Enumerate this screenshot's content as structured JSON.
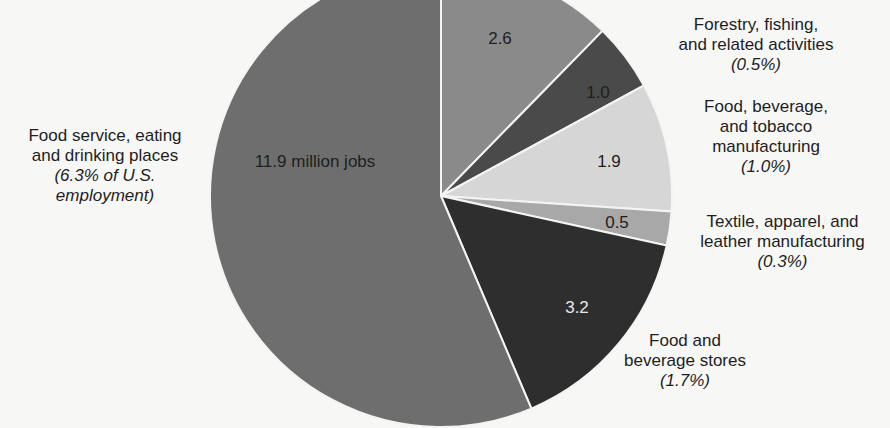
{
  "chart_data": {
    "type": "pie",
    "title": "",
    "units": "million jobs",
    "start_angle_deg": 0,
    "direction": "clockwise",
    "slices": [
      {
        "name": "(cut off, unlabeled)",
        "value": 2.6,
        "value_label": "2.6",
        "share_label": "",
        "color": "#8a8a8a"
      },
      {
        "name": "Forestry, fishing, and related activities",
        "value": 1.0,
        "value_label": "1.0",
        "share_label": "(0.5%)",
        "color": "#4a4a4a"
      },
      {
        "name": "Food, beverage, and tobacco manufacturing",
        "value": 1.9,
        "value_label": "1.9",
        "share_label": "(1.0%)",
        "color": "#d6d6d6"
      },
      {
        "name": "Textile, apparel, and leather manufacturing",
        "value": 0.5,
        "value_label": "0.5",
        "share_label": "(0.3%)",
        "color": "#a8a8a8"
      },
      {
        "name": "Food and beverage stores",
        "value": 3.2,
        "value_label": "3.2",
        "share_label": "(1.7%)",
        "color": "#2e2e2e"
      },
      {
        "name": "Food service, eating and drinking places",
        "value": 11.9,
        "value_label": "11.9 million jobs",
        "share_label": "(6.3% of U.S. employment)",
        "color": "#6e6e6e"
      }
    ]
  },
  "labels": {
    "forestry": {
      "lines": [
        "Forestry, fishing,",
        "and related activities"
      ],
      "pct": "(0.5%)"
    },
    "food_mfg": {
      "lines": [
        "Food, beverage,",
        "and tobacco",
        "manufacturing"
      ],
      "pct": "(1.0%)"
    },
    "textile": {
      "lines": [
        "Textile, apparel, and",
        "leather manufacturing"
      ],
      "pct": "(0.3%)"
    },
    "food_stores": {
      "lines": [
        "Food and",
        "beverage stores"
      ],
      "pct": "(1.7%)"
    },
    "food_service": {
      "lines": [
        "Food service, eating",
        "and drinking places"
      ],
      "pct_lines": [
        "(6.3% of U.S.",
        "employment)"
      ]
    }
  },
  "values": {
    "agri": "2.6",
    "forestry": "1.0",
    "food_mfg": "1.9",
    "textile": "0.5",
    "food_stores": "3.2",
    "food_service": "11.9 million jobs"
  }
}
